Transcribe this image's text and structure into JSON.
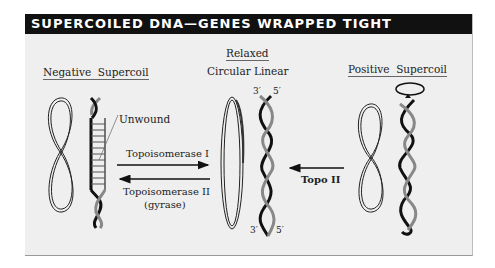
{
  "title": "SUPERCOILED DNA—GENES WRAPPED TIGHT",
  "sections": {
    "negative": {
      "word1": "Negative",
      "word2": "Supercoil"
    },
    "relaxed": {
      "heading": "Relaxed",
      "circular": "Circular",
      "linear": "Linear"
    },
    "positive": {
      "word1": "Positive",
      "word2": "Supercoil"
    }
  },
  "annotations": {
    "unwound": "Unwound",
    "top_left_prime": "3′",
    "top_right_prime": "5′",
    "bottom_left_prime": "3′",
    "bottom_right_prime": "5′"
  },
  "arrows": {
    "topo1": "Topoisomerase I",
    "topo2_line1": "Topoisomerase II",
    "topo2_line2": "(gyrase)",
    "topo2_short": "Topo II"
  }
}
